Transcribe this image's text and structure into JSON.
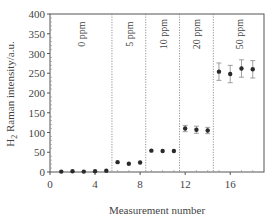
{
  "chart_data": {
    "type": "scatter",
    "title": "",
    "xlabel": "Measurement number",
    "ylabel": "H2 Raman intensity/a.u.",
    "ylabel_main": "H",
    "ylabel_sub": "2",
    "ylabel_rest": " Raman intensity/a.u.",
    "xlim": [
      0,
      19
    ],
    "ylim": [
      0,
      400
    ],
    "xticks": [
      0,
      4,
      8,
      12,
      16
    ],
    "yticks": [
      0,
      50,
      100,
      150,
      200,
      250,
      300,
      350,
      400
    ],
    "grid": false,
    "legend": null,
    "separators_x": [
      5.5,
      8.5,
      11.5,
      14.5
    ],
    "groups": [
      {
        "label": "0 ppm",
        "x_center": 2.75
      },
      {
        "label": "5 ppm",
        "x_center": 7.0
      },
      {
        "label": "10 ppm",
        "x_center": 10.0
      },
      {
        "label": "20 ppm",
        "x_center": 13.0
      },
      {
        "label": "50 ppm",
        "x_center": 16.75
      }
    ],
    "series": [
      {
        "name": "H2 Raman intensity",
        "x": [
          1,
          2,
          3,
          4,
          5,
          6,
          7,
          8,
          9,
          10,
          11,
          12,
          13,
          14,
          15,
          16,
          17,
          18
        ],
        "y": [
          1,
          2,
          1,
          2,
          3,
          25,
          21,
          24,
          54,
          53,
          53,
          110,
          107,
          105,
          254,
          248,
          262,
          260
        ],
        "yerr": [
          2,
          2,
          2,
          2,
          2,
          3,
          3,
          3,
          3,
          3,
          3,
          8,
          9,
          8,
          22,
          22,
          22,
          22
        ]
      }
    ]
  }
}
